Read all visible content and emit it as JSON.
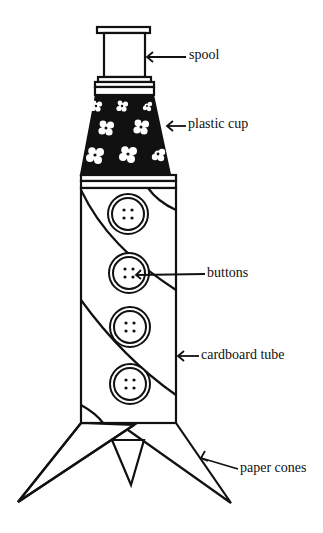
{
  "diagram": {
    "labels": [
      {
        "id": "spool",
        "text": "spool"
      },
      {
        "id": "plastic-cup",
        "text": "plastic cup"
      },
      {
        "id": "buttons",
        "text": "buttons"
      },
      {
        "id": "cardboard-tube",
        "text": "cardboard tube"
      },
      {
        "id": "paper-cones",
        "text": "paper cones"
      }
    ],
    "parts_count": {
      "buttons": 4,
      "cones": 3
    },
    "colors": {
      "ink": "#111111",
      "background": "#ffffff"
    }
  }
}
